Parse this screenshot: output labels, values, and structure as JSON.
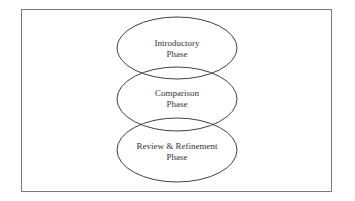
{
  "diagram": {
    "type": "overlapping-ellipses",
    "frame": {
      "border_color": "#7a7a7a"
    },
    "stroke_color": "#2a2a2a",
    "phases": [
      {
        "line1": "Introductory",
        "line2": "Phase",
        "cx": 177,
        "cy": 48,
        "rx": 60,
        "ry": 31
      },
      {
        "line1": "Comparison",
        "line2": "Phase",
        "cx": 177,
        "cy": 99,
        "rx": 60,
        "ry": 32
      },
      {
        "line1": "Review & Refinement",
        "line2": "Phase",
        "cx": 177,
        "cy": 150,
        "rx": 60,
        "ry": 32
      }
    ]
  }
}
